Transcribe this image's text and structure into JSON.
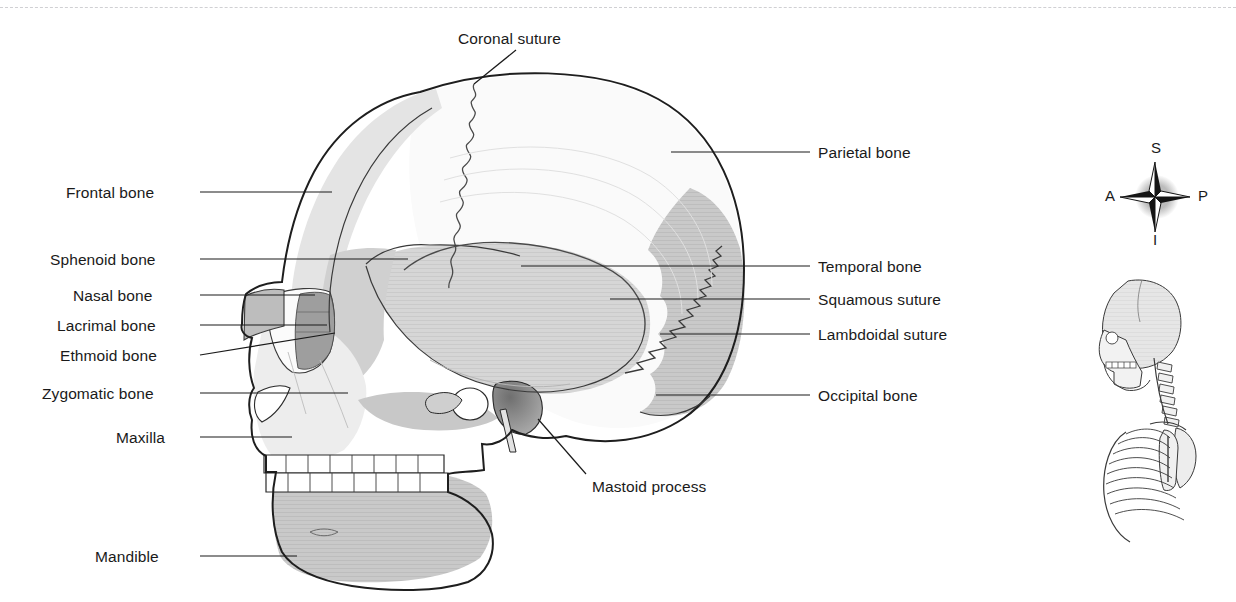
{
  "figure": {
    "title_text": "",
    "background_color": "#ffffff"
  },
  "divider": {
    "name": "top-dashed-rule",
    "color": "#c8c8cc",
    "style": "dashed"
  },
  "labels_left": [
    {
      "text": "Frontal bone",
      "x": 66,
      "y": 185,
      "anchor_x": 200,
      "anchor_y": 192,
      "target_x": 332,
      "target_y": 192
    },
    {
      "text": "Sphenoid bone",
      "x": 50,
      "y": 252,
      "anchor_x": 200,
      "anchor_y": 259,
      "target_x": 408,
      "target_y": 259
    },
    {
      "text": "Nasal bone",
      "x": 73,
      "y": 288,
      "anchor_x": 200,
      "anchor_y": 295,
      "target_x": 315,
      "target_y": 295
    },
    {
      "text": "Lacrimal bone",
      "x": 57,
      "y": 318,
      "anchor_x": 200,
      "anchor_y": 325,
      "target_x": 327,
      "target_y": 325
    },
    {
      "text": "Ethmoid bone",
      "x": 60,
      "y": 348,
      "anchor_x": 200,
      "anchor_y": 355,
      "target_x": 335,
      "target_y": 333
    },
    {
      "text": "Zygomatic bone",
      "x": 42,
      "y": 386,
      "anchor_x": 200,
      "anchor_y": 393,
      "target_x": 348,
      "target_y": 393
    },
    {
      "text": "Maxilla",
      "x": 116,
      "y": 430,
      "anchor_x": 200,
      "anchor_y": 437,
      "target_x": 292,
      "target_y": 437
    },
    {
      "text": "Mandible",
      "x": 95,
      "y": 549,
      "anchor_x": 200,
      "anchor_y": 556,
      "target_x": 297,
      "target_y": 556
    }
  ],
  "labels_right": [
    {
      "text": "Parietal bone",
      "x": 818,
      "y": 145,
      "anchor_x": 810,
      "anchor_y": 152,
      "target_x": 671,
      "target_y": 152
    },
    {
      "text": "Temporal bone",
      "x": 818,
      "y": 259,
      "anchor_x": 810,
      "anchor_y": 266,
      "target_x": 521,
      "target_y": 266
    },
    {
      "text": "Squamous suture",
      "x": 818,
      "y": 292,
      "anchor_x": 810,
      "anchor_y": 299,
      "target_x": 610,
      "target_y": 299
    },
    {
      "text": "Lambdoidal suture",
      "x": 818,
      "y": 327,
      "anchor_x": 810,
      "anchor_y": 334,
      "target_x": 660,
      "target_y": 334
    },
    {
      "text": "Occipital bone",
      "x": 818,
      "y": 388,
      "anchor_x": 810,
      "anchor_y": 395,
      "target_x": 656,
      "target_y": 395
    }
  ],
  "labels_callout": [
    {
      "text": "Coronal suture",
      "x": 458,
      "y": 31,
      "anchor_x": 516,
      "anchor_y": 50,
      "target_x": 474,
      "target_y": 84
    },
    {
      "text": "Mastoid process",
      "x": 592,
      "y": 479,
      "anchor_x": 586,
      "anchor_y": 474,
      "target_x": 538,
      "target_y": 419
    }
  ],
  "compass": {
    "name": "orientation-rose",
    "superior": "S",
    "anterior": "A",
    "posterior": "P",
    "inferior": "I",
    "center_x": 1155,
    "center_y": 194,
    "shadow_color": "#b5b5b5",
    "star_dark": "#141414",
    "star_light": "#ffffff"
  },
  "thumbnail": {
    "name": "skeleton-orientation-thumbnail",
    "description": "Lateral upper-body skeleton showing skull, cervical vertebrae, ribcage, scapula and humerus",
    "x": 1098,
    "y": 272,
    "width": 122,
    "height": 200
  },
  "colors": {
    "outline": "#1e1e1e",
    "suture_line": "#4a4a4a",
    "frontal_fill": "#e2e2e2",
    "parietal_fill": "#fafafa",
    "temporal_fill": "#d4d4d4",
    "occipital_fill": "#c9c9c9",
    "mandible_fill": "#cfcfcf",
    "maxilla_fill": "#e6e6e6",
    "orbit_fill": "#fbfbfb",
    "lacrimal_fill": "#9d9d9d",
    "nasal_fill": "#b9b9b9",
    "mastoid_fill": "#8f8f8f",
    "teeth_fill": "#ffffff",
    "label_text": "#1a1a1a",
    "leader_line": "#1a1a1a"
  }
}
